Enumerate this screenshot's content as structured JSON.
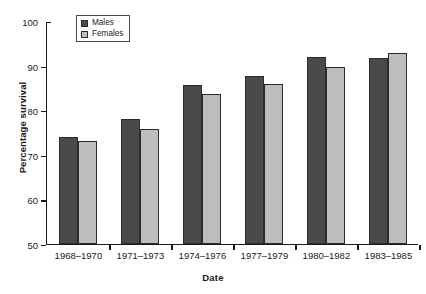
{
  "chart_data": {
    "type": "bar",
    "title": "",
    "xlabel": "Date",
    "ylabel": "Percentage survival",
    "categories": [
      "1968–1970",
      "1971–1973",
      "1974–1976",
      "1977–1979",
      "1980–1982",
      "1983–1985"
    ],
    "series": [
      {
        "name": "Males",
        "color": "#4a4a4a",
        "values": [
          73.8,
          78.0,
          85.6,
          87.5,
          91.8,
          91.6
        ]
      },
      {
        "name": "Females",
        "color": "#bdbdbd",
        "values": [
          73.0,
          75.6,
          83.5,
          85.8,
          89.6,
          92.8
        ]
      }
    ],
    "ylim": [
      50,
      100
    ],
    "yticks": [
      50,
      60,
      70,
      80,
      90,
      100
    ],
    "ytick_labels": [
      "50",
      "60",
      "70",
      "80",
      "90",
      "100"
    ],
    "grid": false,
    "legend_position": "top-left"
  }
}
